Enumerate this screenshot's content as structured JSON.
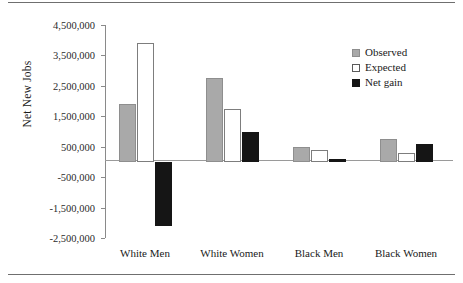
{
  "chart_data": {
    "type": "bar",
    "title": "",
    "xlabel": "",
    "ylabel": "Net New Jobs",
    "categories": [
      "White Men",
      "White Women",
      "Black Men",
      "Black Women"
    ],
    "series": [
      {
        "name": "Observed",
        "color": "#a9a9a9",
        "values": [
          1900000,
          2750000,
          500000,
          750000
        ]
      },
      {
        "name": "Expected",
        "color": "#ffffff",
        "values": [
          3900000,
          1750000,
          400000,
          300000
        ]
      },
      {
        "name": "Net gain",
        "color": "#151515",
        "values": [
          -2100000,
          1000000,
          100000,
          600000
        ]
      }
    ],
    "ylim": [
      -2500000,
      4500000
    ],
    "ytick_values": [
      4500000,
      3500000,
      2500000,
      1500000,
      500000,
      -500000,
      -1500000,
      -2500000
    ],
    "ytick_labels": [
      "4,500,000",
      "3,500,000",
      "2,500,000",
      "1,500,000",
      "500,000",
      "-500,000",
      "-1,500,000",
      "-2,500,000"
    ],
    "grid": false,
    "legend_position": "upper right",
    "zero_line": true
  },
  "legend": {
    "items": [
      {
        "label": "Observed",
        "swatch": "observed"
      },
      {
        "label": "Expected",
        "swatch": "expected"
      },
      {
        "label": "Net gain",
        "swatch": "netgain"
      }
    ]
  }
}
